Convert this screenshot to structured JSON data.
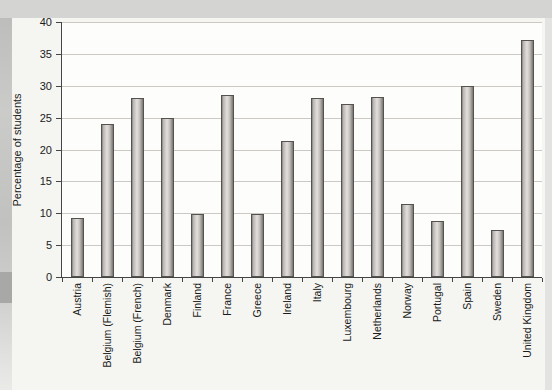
{
  "page": {
    "background_color": "#e3e3e1",
    "top_band_color": "#d4d4d2",
    "left_strip_color": "#c1c1bf",
    "left_block_color": "#a8a8a6",
    "chart_background_color": "#f5f5f2"
  },
  "chart_data": {
    "type": "bar",
    "title": "Cannabis use among students 15–16",
    "ylabel": "Percentage of students",
    "xlabel": "",
    "ylim": [
      0,
      40
    ],
    "yticks": [
      0,
      5,
      10,
      15,
      20,
      25,
      30,
      35,
      40
    ],
    "grid": true,
    "legend": null,
    "categories": [
      "Austria",
      "Belgium (Flemish)",
      "Belgium (French)",
      "Denmark",
      "Finland",
      "France",
      "Greece",
      "Ireland",
      "Italy",
      "Luxembourg",
      "Netherlands",
      "Norway",
      "Portugal",
      "Spain",
      "Sweden",
      "United Kingdom"
    ],
    "values": [
      9.3,
      24,
      28,
      25,
      9.9,
      28.6,
      9.9,
      21.3,
      28.1,
      27.1,
      28.3,
      11.4,
      8.8,
      29.9,
      7.4,
      37.1
    ],
    "plot_bg": "#fdfdfc",
    "gridline_color": "#ccc8c3",
    "axis_color": "#454545",
    "bar_color": "#c9c6c2",
    "bar_border_color": "#55524f",
    "text_color": "#1b1b1b"
  }
}
